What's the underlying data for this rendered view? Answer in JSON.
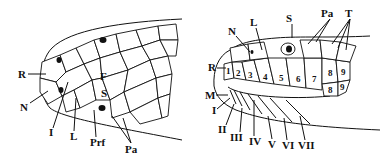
{
  "figure": {
    "left_panel": {
      "view": "dorsal",
      "labels": {
        "R": "R",
        "N": "N",
        "F": "F",
        "S": "S",
        "I": "I",
        "L": "L",
        "Prf": "Prf",
        "Pa": "Pa"
      }
    },
    "right_panel": {
      "view": "lateral",
      "labels": {
        "N": "N",
        "L": "L",
        "S": "S",
        "Pa": "Pa",
        "T": "T",
        "R": "R",
        "M": "M"
      },
      "upper_labials": [
        "1",
        "2",
        "3",
        "4",
        "5",
        "6",
        "7",
        "8",
        "9"
      ],
      "lower_second_row": [
        "8",
        "9"
      ],
      "lower_labials": [
        "I",
        "II",
        "III",
        "IV",
        "V",
        "VI",
        "VII"
      ]
    }
  }
}
